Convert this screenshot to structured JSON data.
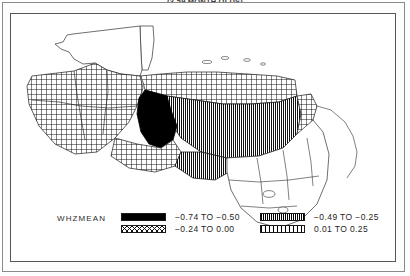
{
  "title": "(3-59 MONTH OLDS)",
  "map": {
    "legend": {
      "variable_label": "WHZMEAN",
      "classes": [
        {
          "pattern": "solid-black",
          "range": "−0.74 TO −0.50",
          "from": -0.74,
          "to": -0.5
        },
        {
          "pattern": "dense-vertical",
          "range": "−0.49 TO −0.25",
          "from": -0.49,
          "to": -0.25
        },
        {
          "pattern": "cross-hatch",
          "range": "−0.24 TO  0.00",
          "from": -0.24,
          "to": 0.0
        },
        {
          "pattern": "light-vertical",
          "range": " 0.01 TO  0.25",
          "from": 0.01,
          "to": 0.25
        }
      ]
    },
    "regions": [
      {
        "name": "guatemala-peten",
        "fill": "none"
      },
      {
        "name": "guatemala-west",
        "fill": "cross-hatch"
      },
      {
        "name": "guatemala-central",
        "fill": "cross-hatch"
      },
      {
        "name": "guatemala-south",
        "fill": "cross-hatch"
      },
      {
        "name": "honduras-west-black",
        "fill": "solid-black"
      },
      {
        "name": "honduras-central",
        "fill": "dense-vertical"
      },
      {
        "name": "honduras-north",
        "fill": "cross-hatch"
      },
      {
        "name": "el-salvador",
        "fill": "cross-hatch"
      },
      {
        "name": "el-salvador-east",
        "fill": "dense-vertical"
      },
      {
        "name": "nicaragua",
        "fill": "none"
      },
      {
        "name": "belize",
        "fill": "none"
      }
    ]
  }
}
